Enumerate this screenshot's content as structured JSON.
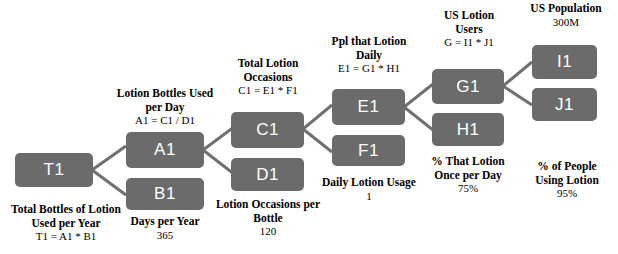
{
  "diagram": {
    "type": "issue-tree",
    "title_fragment": "",
    "colors": {
      "node_fill": "#6b6b6b",
      "node_text": "#ffffff",
      "connector": "#707070",
      "caption_text": "#000000",
      "background": "#ffffff"
    },
    "nodes": [
      {
        "id": "T1",
        "label": "T1"
      },
      {
        "id": "A1",
        "label": "A1"
      },
      {
        "id": "B1",
        "label": "B1"
      },
      {
        "id": "C1",
        "label": "C1"
      },
      {
        "id": "D1",
        "label": "D1"
      },
      {
        "id": "E1",
        "label": "E1"
      },
      {
        "id": "F1",
        "label": "F1"
      },
      {
        "id": "G1",
        "label": "G1"
      },
      {
        "id": "H1",
        "label": "H1"
      },
      {
        "id": "I1",
        "label": "I1"
      },
      {
        "id": "J1",
        "label": "J1"
      }
    ],
    "captions": {
      "t1": {
        "title": "Total Bottles of Lotion Used per Year",
        "formula": "T1 = A1 * B1",
        "value": ""
      },
      "a1": {
        "title": "Lotion Bottles Used per Day",
        "formula": "A1 = C1 / D1",
        "value": ""
      },
      "b1": {
        "title": "Days per Year",
        "formula": "",
        "value": "365"
      },
      "c1": {
        "title": "Total Lotion Occasions",
        "formula": "C1 = E1 * F1",
        "value": ""
      },
      "d1": {
        "title": "Lotion Occasions per Bottle",
        "formula": "",
        "value": "120"
      },
      "e1": {
        "title": "Ppl that Lotion Daily",
        "formula": "E1 = G1 * H1",
        "value": ""
      },
      "f1": {
        "title": "Daily Lotion Usage",
        "formula": "",
        "value": "1"
      },
      "g1": {
        "title": "US Lotion Users",
        "formula": "G = I1 * J1",
        "value": ""
      },
      "h1": {
        "title": "% That Lotion Once per Day",
        "formula": "",
        "value": "75%"
      },
      "i1": {
        "title": "US Population",
        "formula": "",
        "value": "300M"
      },
      "j1": {
        "title": "% of People Using Lotion",
        "formula": "",
        "value": "95%"
      }
    },
    "edges": [
      {
        "from": "T1",
        "to": "A1"
      },
      {
        "from": "T1",
        "to": "B1"
      },
      {
        "from": "A1",
        "to": "C1"
      },
      {
        "from": "A1",
        "to": "D1"
      },
      {
        "from": "C1",
        "to": "E1"
      },
      {
        "from": "C1",
        "to": "F1"
      },
      {
        "from": "E1",
        "to": "G1"
      },
      {
        "from": "E1",
        "to": "H1"
      },
      {
        "from": "G1",
        "to": "I1"
      },
      {
        "from": "G1",
        "to": "J1"
      }
    ]
  }
}
